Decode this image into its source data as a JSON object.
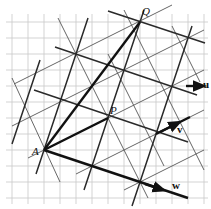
{
  "diagram": {
    "type": "lattice-vector-diagram",
    "grid": {
      "spacing_px": 16,
      "x_lines": [
        12,
        28,
        44,
        60,
        76,
        92,
        108,
        124,
        140,
        156,
        172,
        188,
        204
      ],
      "y_lines": [
        22,
        38,
        54,
        70,
        86,
        102,
        118,
        134,
        150,
        166,
        182,
        198
      ],
      "color": "#c8c8c8"
    },
    "points": {
      "A": {
        "label": "A",
        "x": 44,
        "y": 150
      },
      "P": {
        "label": "P",
        "x": 108,
        "y": 118
      },
      "Q": {
        "label": "Q",
        "x": 140,
        "y": 22
      }
    },
    "vectors": {
      "u": {
        "label": "u"
      },
      "v": {
        "label": "v"
      },
      "w": {
        "label": "w"
      }
    },
    "basis_cells": {
      "d": [
        3,
        1
      ],
      "c": [
        1,
        -3
      ]
    },
    "line_color": "#222222"
  }
}
